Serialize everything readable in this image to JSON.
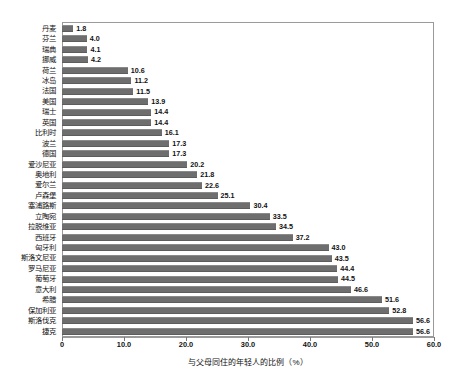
{
  "chart_data": {
    "type": "bar",
    "orientation": "horizontal",
    "title": "",
    "xlabel": "与父母同住的年轻人的比例（%）",
    "ylabel": "",
    "xlim": [
      0,
      60
    ],
    "grid": false,
    "legend": null,
    "bar_color": "#6e6e6e",
    "frame_color": "#9a9a9a",
    "xticks": [
      "0",
      "10.0",
      "20.0",
      "30.0",
      "40.0",
      "50.0",
      "60.0"
    ],
    "xtick_values": [
      0,
      10,
      20,
      30,
      40,
      50,
      60
    ],
    "categories": [
      "丹麦",
      "芬兰",
      "瑞典",
      "挪威",
      "荷兰",
      "冰岛",
      "法国",
      "美国",
      "瑞士",
      "英国",
      "比利时",
      "波兰",
      "德国",
      "爱沙尼亚",
      "奥地利",
      "爱尔兰",
      "卢森堡",
      "塞浦路斯",
      "立陶宛",
      "拉脱维亚",
      "西班牙",
      "匈牙利",
      "斯洛文尼亚",
      "罗马尼亚",
      "葡萄牙",
      "意大利",
      "希腊",
      "保加利亚",
      "斯洛伐克",
      "捷克"
    ],
    "values": [
      1.8,
      4.0,
      4.1,
      4.2,
      10.6,
      11.2,
      11.5,
      13.9,
      14.4,
      14.4,
      16.1,
      17.3,
      17.3,
      20.2,
      21.8,
      22.6,
      25.1,
      30.4,
      33.5,
      34.5,
      37.2,
      43.0,
      43.5,
      44.4,
      44.5,
      46.6,
      51.6,
      52.8,
      56.6,
      56.6
    ],
    "value_labels": [
      "1.8",
      "4.0",
      "4.1",
      "4.2",
      "10.6",
      "11.2",
      "11.5",
      "13.9",
      "14.4",
      "14.4",
      "16.1",
      "17.3",
      "17.3",
      "20.2",
      "21.8",
      "22.6",
      "25.1",
      "30.4",
      "33.5",
      "34.5",
      "37.2",
      "43.0",
      "43.5",
      "44.4",
      "44.5",
      "46.6",
      "51.6",
      "52.8",
      "56.6",
      "56.6"
    ]
  }
}
